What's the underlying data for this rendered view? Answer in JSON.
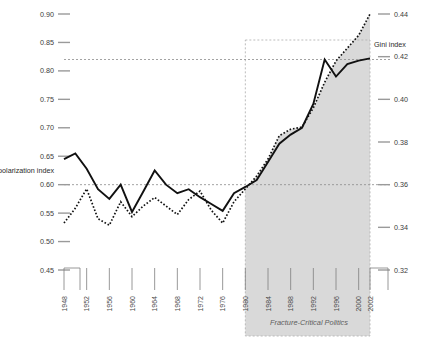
{
  "chart_data": {
    "type": "line",
    "title": "",
    "xlabel": "",
    "grid": false,
    "legend_position": "inline-axis-labels",
    "x": [
      1948,
      1950,
      1952,
      1954,
      1956,
      1958,
      1960,
      1962,
      1964,
      1966,
      1968,
      1970,
      1972,
      1974,
      1976,
      1978,
      1980,
      1982,
      1984,
      1986,
      1988,
      1990,
      1992,
      1994,
      1996,
      1998,
      2000,
      2002
    ],
    "axes": {
      "left": {
        "label": "polarization index",
        "ticks": [
          "0.90",
          "0.85",
          "0.80",
          "0.75",
          "0.70",
          "0.65",
          "0.60",
          "0.55",
          "0.50",
          "0.45"
        ],
        "min": 0.45,
        "max": 0.9
      },
      "right": {
        "label": "Gini index",
        "ticks": [
          "0.44",
          "0.42",
          "0.40",
          "0.38",
          "0.36",
          "0.34",
          "0.32"
        ],
        "min": 0.32,
        "max": 0.44
      }
    },
    "year_ticks": [
      "1948",
      "1952",
      "1956",
      "1960",
      "1964",
      "1968",
      "1972",
      "1976",
      "1980",
      "1984",
      "1988",
      "1992",
      "1996",
      "2000",
      "2002"
    ],
    "series": [
      {
        "name": "polarization index",
        "style": "solid",
        "axis": "left",
        "values": [
          0.645,
          0.655,
          0.628,
          0.592,
          0.575,
          0.6,
          0.552,
          0.588,
          0.625,
          0.6,
          0.585,
          0.592,
          0.578,
          0.566,
          0.554,
          0.585,
          0.596,
          0.608,
          0.64,
          0.672,
          0.688,
          0.7,
          0.742,
          0.82,
          0.79,
          0.812,
          0.818,
          0.822
        ]
      },
      {
        "name": "Gini index",
        "style": "dotted",
        "axis": "right",
        "values": [
          0.342,
          0.349,
          0.358,
          0.344,
          0.341,
          0.352,
          0.345,
          0.35,
          0.354,
          0.35,
          0.346,
          0.353,
          0.357,
          0.348,
          0.342,
          0.352,
          0.358,
          0.364,
          0.372,
          0.383,
          0.386,
          0.387,
          0.396,
          0.408,
          0.418,
          0.424,
          0.43,
          0.44
        ]
      }
    ],
    "reference_lines": [
      {
        "axis": "left",
        "value": 0.82,
        "style": "dashed"
      },
      {
        "axis": "left",
        "value": 0.6,
        "style": "dashed"
      }
    ],
    "annotations": [
      {
        "text": "Fracture-Critical Politics",
        "start_year": 1980,
        "end_year": 2002,
        "style": "italic",
        "shaded": true
      }
    ]
  },
  "era": {
    "label": "Fracture-Critical Politics"
  },
  "left_axis": {
    "name": "polarization index",
    "t0": "0.90",
    "t1": "0.85",
    "t2": "0.80",
    "t3": "0.75",
    "t4": "0.70",
    "t5": "0.65",
    "t6": "0.60",
    "t7": "0.55",
    "t8": "0.50",
    "t9": "0.45"
  },
  "right_axis": {
    "name": "Gini index",
    "t0": "0.44",
    "t1": "0.42",
    "t2": "0.40",
    "t3": "0.38",
    "t4": "0.36",
    "t5": "0.34",
    "t6": "0.32"
  },
  "years": {
    "y0": "1948",
    "y1": "1952",
    "y2": "1956",
    "y3": "1960",
    "y4": "1964",
    "y5": "1968",
    "y6": "1972",
    "y7": "1976",
    "y8": "1980",
    "y9": "1984",
    "y10": "1988",
    "y11": "1992",
    "y12": "1996",
    "y13": "2000",
    "y14": "2002"
  }
}
